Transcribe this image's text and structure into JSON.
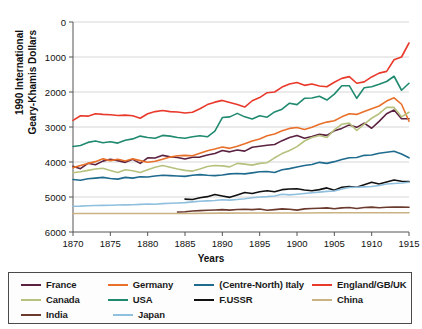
{
  "chart_data": {
    "type": "line",
    "title": "",
    "xlabel": "Years",
    "ylabel": "1990 International Geary-Khamis Dollars",
    "xlim": [
      1870,
      1915
    ],
    "ylim": [
      0,
      6000
    ],
    "xticks": [
      1870,
      1875,
      1880,
      1885,
      1890,
      1895,
      1900,
      1905,
      1910,
      1915
    ],
    "yticks": [
      0,
      1000,
      2000,
      3000,
      4000,
      5000,
      6000
    ],
    "grid": true,
    "legend_position": "below",
    "series": [
      {
        "name": "France",
        "color": "#5b2140",
        "x": [
          1870,
          1871,
          1872,
          1873,
          1874,
          1875,
          1876,
          1877,
          1878,
          1879,
          1880,
          1881,
          1882,
          1883,
          1884,
          1885,
          1886,
          1887,
          1888,
          1889,
          1890,
          1891,
          1892,
          1893,
          1894,
          1895,
          1896,
          1897,
          1898,
          1899,
          1900,
          1901,
          1902,
          1903,
          1904,
          1905,
          1906,
          1907,
          1908,
          1909,
          1910,
          1911,
          1912,
          1913,
          1914,
          1915
        ],
        "values": [
          1876,
          1810,
          1962,
          1920,
          2025,
          2080,
          2040,
          1990,
          2075,
          1960,
          2120,
          2115,
          2190,
          2150,
          2130,
          2085,
          2135,
          2140,
          2200,
          2245,
          2330,
          2290,
          2345,
          2310,
          2420,
          2450,
          2480,
          2500,
          2610,
          2700,
          2760,
          2680,
          2730,
          2790,
          2760,
          2890,
          2960,
          3060,
          2990,
          3110,
          2965,
          3160,
          3380,
          3485,
          3240,
          3235
        ]
      },
      {
        "name": "Germany",
        "color": "#e8702a",
        "x": [
          1870,
          1871,
          1872,
          1873,
          1874,
          1875,
          1876,
          1877,
          1878,
          1879,
          1880,
          1881,
          1882,
          1883,
          1884,
          1885,
          1886,
          1887,
          1888,
          1889,
          1890,
          1891,
          1892,
          1893,
          1894,
          1895,
          1896,
          1897,
          1898,
          1899,
          1900,
          1901,
          1902,
          1903,
          1904,
          1905,
          1906,
          1907,
          1908,
          1909,
          1910,
          1911,
          1912,
          1913,
          1914,
          1915
        ],
        "values": [
          1839,
          1900,
          1960,
          2010,
          2090,
          2040,
          2080,
          2030,
          2090,
          2040,
          1991,
          2020,
          2080,
          2140,
          2180,
          2190,
          2180,
          2250,
          2320,
          2370,
          2428,
          2390,
          2450,
          2520,
          2600,
          2660,
          2750,
          2800,
          2890,
          2960,
          2985,
          2930,
          2990,
          3080,
          3140,
          3180,
          3290,
          3380,
          3360,
          3440,
          3520,
          3600,
          3740,
          3833,
          3650,
          3165
        ]
      },
      {
        "name": "(Centre-North) Italy",
        "color": "#1f6b8e",
        "x": [
          1870,
          1871,
          1872,
          1873,
          1874,
          1875,
          1876,
          1877,
          1878,
          1879,
          1880,
          1881,
          1882,
          1883,
          1884,
          1885,
          1886,
          1887,
          1888,
          1889,
          1890,
          1891,
          1892,
          1893,
          1894,
          1895,
          1896,
          1897,
          1898,
          1899,
          1900,
          1901,
          1902,
          1903,
          1904,
          1905,
          1906,
          1907,
          1908,
          1909,
          1910,
          1911,
          1912,
          1913,
          1914,
          1915
        ],
        "values": [
          1499,
          1480,
          1520,
          1540,
          1560,
          1530,
          1510,
          1560,
          1540,
          1580,
          1570,
          1600,
          1620,
          1610,
          1600,
          1590,
          1620,
          1640,
          1620,
          1610,
          1630,
          1660,
          1670,
          1660,
          1690,
          1720,
          1730,
          1700,
          1780,
          1810,
          1855,
          1900,
          1930,
          1990,
          1960,
          2010,
          2070,
          2120,
          2130,
          2190,
          2200,
          2250,
          2280,
          2305,
          2230,
          2120
        ]
      },
      {
        "name": "England/GB/UK",
        "color": "#e8392b",
        "x": [
          1870,
          1871,
          1872,
          1873,
          1874,
          1875,
          1876,
          1877,
          1878,
          1879,
          1880,
          1881,
          1882,
          1883,
          1884,
          1885,
          1886,
          1887,
          1888,
          1889,
          1890,
          1891,
          1892,
          1893,
          1894,
          1895,
          1896,
          1897,
          1898,
          1899,
          1900,
          1901,
          1902,
          1903,
          1904,
          1905,
          1906,
          1907,
          1908,
          1909,
          1910,
          1911,
          1912,
          1913,
          1914,
          1915
        ],
        "values": [
          3190,
          3320,
          3310,
          3380,
          3360,
          3350,
          3330,
          3340,
          3320,
          3250,
          3380,
          3440,
          3470,
          3440,
          3430,
          3400,
          3420,
          3520,
          3640,
          3710,
          3760,
          3700,
          3640,
          3570,
          3750,
          3840,
          3980,
          4000,
          4140,
          4230,
          4270,
          4190,
          4230,
          4170,
          4150,
          4280,
          4390,
          4440,
          4250,
          4290,
          4430,
          4540,
          4590,
          4921,
          5000,
          5400
        ]
      },
      {
        "name": "Canada",
        "color": "#b7c17e",
        "x": [
          1870,
          1871,
          1872,
          1873,
          1874,
          1875,
          1876,
          1877,
          1878,
          1879,
          1880,
          1881,
          1882,
          1883,
          1884,
          1885,
          1886,
          1887,
          1888,
          1889,
          1890,
          1891,
          1892,
          1893,
          1894,
          1895,
          1896,
          1897,
          1898,
          1899,
          1900,
          1901,
          1902,
          1903,
          1904,
          1905,
          1906,
          1907,
          1908,
          1909,
          1910,
          1911,
          1912,
          1913,
          1914,
          1915
        ],
        "values": [
          1695,
          1720,
          1760,
          1800,
          1820,
          1760,
          1700,
          1780,
          1750,
          1700,
          1780,
          1850,
          1900,
          1850,
          1800,
          1760,
          1740,
          1800,
          1870,
          1900,
          1890,
          1860,
          1960,
          1940,
          1910,
          1960,
          1980,
          2120,
          2240,
          2330,
          2440,
          2600,
          2700,
          2760,
          2700,
          2920,
          3080,
          3110,
          2900,
          3080,
          3250,
          3380,
          3560,
          3560,
          3290,
          3420
        ]
      },
      {
        "name": "USA",
        "color": "#1f8a70",
        "x": [
          1870,
          1871,
          1872,
          1873,
          1874,
          1875,
          1876,
          1877,
          1878,
          1879,
          1880,
          1881,
          1882,
          1883,
          1884,
          1885,
          1886,
          1887,
          1888,
          1889,
          1890,
          1891,
          1892,
          1893,
          1894,
          1895,
          1896,
          1897,
          1898,
          1899,
          1900,
          1901,
          1902,
          1903,
          1904,
          1905,
          1906,
          1907,
          1908,
          1909,
          1910,
          1911,
          1912,
          1913,
          1914,
          1915
        ],
        "values": [
          2445,
          2470,
          2560,
          2600,
          2550,
          2580,
          2540,
          2620,
          2660,
          2740,
          2700,
          2680,
          2760,
          2740,
          2700,
          2680,
          2720,
          2750,
          2720,
          2880,
          3270,
          3290,
          3390,
          3290,
          3230,
          3320,
          3280,
          3430,
          3510,
          3680,
          3640,
          3820,
          3830,
          3880,
          3770,
          3940,
          4180,
          4180,
          3820,
          4120,
          4150,
          4220,
          4300,
          4450,
          4050,
          4250
        ]
      },
      {
        "name": "F.USSR",
        "color": "#111111",
        "x": [
          1885,
          1886,
          1887,
          1888,
          1889,
          1890,
          1891,
          1892,
          1893,
          1894,
          1895,
          1896,
          1897,
          1898,
          1899,
          1900,
          1901,
          1902,
          1903,
          1904,
          1905,
          1906,
          1907,
          1908,
          1909,
          1910,
          1911,
          1912,
          1913,
          1914,
          1915
        ],
        "values": [
          940,
          930,
          980,
          1010,
          1070,
          1030,
          990,
          1060,
          1130,
          1100,
          1150,
          1180,
          1150,
          1210,
          1230,
          1237,
          1200,
          1180,
          1210,
          1260,
          1190,
          1280,
          1300,
          1280,
          1350,
          1420,
          1370,
          1430,
          1488,
          1450,
          1440
        ]
      },
      {
        "name": "China",
        "color": "#cbb283",
        "x": [
          1870,
          1875,
          1880,
          1885,
          1890,
          1895,
          1900,
          1905,
          1910,
          1913,
          1915
        ],
        "values": [
          530,
          530,
          530,
          530,
          540,
          545,
          545,
          550,
          552,
          552,
          552
        ]
      },
      {
        "name": "India",
        "color": "#6b3a2e",
        "x": [
          1884,
          1885,
          1886,
          1887,
          1888,
          1889,
          1890,
          1891,
          1892,
          1893,
          1894,
          1895,
          1896,
          1897,
          1898,
          1899,
          1900,
          1901,
          1902,
          1903,
          1904,
          1905,
          1906,
          1907,
          1908,
          1909,
          1910,
          1911,
          1912,
          1913,
          1914,
          1915
        ],
        "values": [
          570,
          580,
          600,
          610,
          620,
          630,
          640,
          625,
          645,
          650,
          640,
          655,
          620,
          640,
          660,
          650,
          625,
          660,
          670,
          680,
          690,
          665,
          690,
          700,
          670,
          700,
          710,
          695,
          705,
          713,
          710,
          705
        ]
      },
      {
        "name": "Japan",
        "color": "#8fc0de",
        "x": [
          1870,
          1871,
          1872,
          1873,
          1874,
          1875,
          1876,
          1877,
          1878,
          1879,
          1880,
          1881,
          1882,
          1883,
          1884,
          1885,
          1886,
          1887,
          1888,
          1889,
          1890,
          1891,
          1892,
          1893,
          1894,
          1895,
          1896,
          1897,
          1898,
          1899,
          1900,
          1901,
          1902,
          1903,
          1904,
          1905,
          1906,
          1907,
          1908,
          1909,
          1910,
          1911,
          1912,
          1913,
          1914,
          1915
        ],
        "values": [
          737,
          740,
          750,
          755,
          760,
          765,
          770,
          775,
          780,
          790,
          800,
          795,
          810,
          820,
          830,
          840,
          860,
          880,
          890,
          900,
          920,
          910,
          930,
          950,
          980,
          1000,
          1010,
          1030,
          1080,
          1060,
          1080,
          1100,
          1120,
          1140,
          1160,
          1170,
          1230,
          1270,
          1280,
          1290,
          1300,
          1330,
          1370,
          1387,
          1400,
          1420
        ]
      }
    ]
  },
  "axis": {
    "ylabel_line1": "1990 International",
    "ylabel_line2": "Geary-Khamis Dollars",
    "xlabel": "Years",
    "yticks": [
      "6000",
      "5000",
      "4000",
      "3000",
      "2000",
      "1000",
      "0"
    ],
    "xticks": [
      "1870",
      "1875",
      "1880",
      "1885",
      "1890",
      "1895",
      "1900",
      "1905",
      "1910",
      "1915"
    ]
  },
  "legend": {
    "rows": [
      [
        {
          "label": "France",
          "color": "#5b2140"
        },
        {
          "label": "Germany",
          "color": "#e8702a"
        },
        {
          "label": "(Centre-North) Italy",
          "color": "#1f6b8e"
        },
        {
          "label": "England/GB/UK",
          "color": "#e8392b"
        }
      ],
      [
        {
          "label": "Canada",
          "color": "#b7c17e"
        },
        {
          "label": "USA",
          "color": "#1f8a70"
        },
        {
          "label": "F.USSR",
          "color": "#111111"
        },
        {
          "label": "China",
          "color": "#cbb283"
        }
      ],
      [
        {
          "label": "India",
          "color": "#6b3a2e"
        },
        {
          "label": "Japan",
          "color": "#8fc0de"
        }
      ]
    ]
  }
}
